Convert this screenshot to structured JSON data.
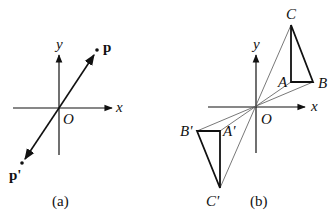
{
  "panel_a": {
    "caption": "(a)",
    "axis_x_label": "x",
    "axis_y_label": "y",
    "origin_label": "O",
    "point_p_label": "p",
    "point_p_prime_label": "p'"
  },
  "panel_b": {
    "caption": "(b)",
    "axis_x_label": "x",
    "axis_y_label": "y",
    "origin_label": "O",
    "vertex_a_label": "A",
    "vertex_b_label": "B",
    "vertex_c_label": "C",
    "vertex_a_prime_label": "A'",
    "vertex_b_prime_label": "B'",
    "vertex_c_prime_label": "C'"
  },
  "colors": {
    "stroke": "#111111",
    "thin_stroke": "#444444"
  }
}
